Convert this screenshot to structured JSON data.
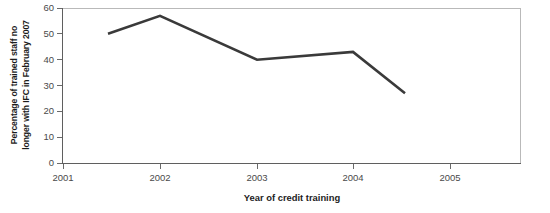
{
  "chart_data": {
    "type": "line",
    "title": "",
    "subtitle": "",
    "xlabel": "Year of credit training",
    "ylabel": "Percentage of trained staff no longer with IFC in February 2007",
    "ylabel_line1": "Percentage of trained staff no",
    "ylabel_line2": "longer with IFC in February 2007",
    "categories": [
      "2001",
      "2002",
      "2003",
      "2004",
      "2005"
    ],
    "values": [
      50,
      57,
      40,
      43,
      27
    ],
    "series": [
      {
        "name": "Percentage of trained staff no longer with IFC in February 2007",
        "values": [
          50,
          57,
          40,
          43,
          27
        ]
      }
    ],
    "ylim": [
      0,
      60
    ],
    "xlim": [
      2001,
      2005
    ],
    "y_ticks": [
      "60",
      "50",
      "40",
      "30",
      "20",
      "10",
      "0"
    ],
    "y_tick_values": [
      60,
      50,
      40,
      30,
      20,
      10,
      0
    ],
    "x_ticks": [
      "2001",
      "2002",
      "2003",
      "2004",
      "2005"
    ],
    "grid": false,
    "legend": "none",
    "line_color": "#3a3a3a",
    "axis_color": "#5f5f5f",
    "frame_color": "#b9b9b9",
    "text_color": "#1c1c1c",
    "tick_text_color": "#4a4a4a",
    "background_color": "#ffffff"
  }
}
